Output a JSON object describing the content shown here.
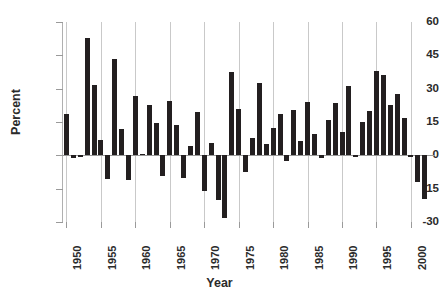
{
  "chart_data": {
    "type": "bar",
    "title": "",
    "subtitle": "",
    "xlabel": "Year",
    "ylabel": "Percent",
    "ylim": [
      -30,
      60
    ],
    "yticks": [
      60,
      45,
      30,
      15,
      0,
      -15,
      -30
    ],
    "ytick_labels": [
      "60",
      "45",
      "30",
      "15",
      "0",
      "-15",
      "-30"
    ],
    "xlim": [
      1949.5,
      2003.5
    ],
    "xticks": [
      1950,
      1955,
      1960,
      1965,
      1970,
      1975,
      1980,
      1985,
      1990,
      1995,
      2000
    ],
    "xtick_labels": [
      "1950",
      "1955",
      "1960",
      "1965",
      "1970",
      "1975",
      "1980",
      "1985",
      "1990",
      "1995",
      "2000"
    ],
    "grid": "vertical-only",
    "legend": "none",
    "bar_color": "#231f20",
    "categories": [
      1950,
      1951,
      1952,
      1953,
      1954,
      1955,
      1956,
      1957,
      1958,
      1959,
      1960,
      1961,
      1962,
      1963,
      1964,
      1965,
      1966,
      1967,
      1968,
      1969,
      1970,
      1971,
      1972,
      1973,
      1974,
      1975,
      1976,
      1977,
      1978,
      1979,
      1980,
      1981,
      1982,
      1983,
      1984,
      1985,
      1986,
      1987,
      1988,
      1989,
      1990,
      1991,
      1992,
      1993,
      1994,
      1995,
      1996,
      1997,
      1998,
      1999,
      2000,
      2001,
      2002
    ],
    "values": [
      18.5,
      -1.0,
      0.0,
      53.0,
      31.5,
      7.0,
      -10.5,
      43.5,
      12.0,
      -11.0,
      26.5,
      0.5,
      22.5,
      14.5,
      -9.5,
      24.5,
      13.5,
      -10.0,
      4.0,
      19.5,
      -16.0,
      5.5,
      -20.0,
      -28.0,
      37.5,
      21.0,
      -7.5,
      8.0,
      32.5,
      5.0,
      12.5,
      18.5,
      -2.5,
      20.5,
      6.5,
      24.0,
      9.5,
      -1.0,
      16.0,
      23.5,
      10.5,
      31.0,
      -0.5,
      15.0,
      20.0,
      38.0,
      36.0,
      22.5,
      27.5,
      17.0,
      -0.5,
      -12.0,
      -19.5
    ],
    "series_name": "Annual percent change"
  },
  "axes": {
    "y_title": "Percent",
    "x_title": "Year"
  }
}
